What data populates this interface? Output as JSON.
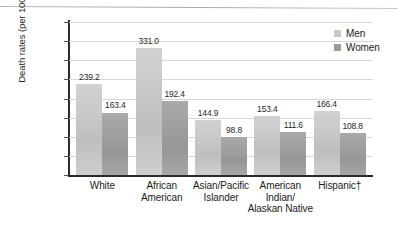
{
  "chart_data": {
    "type": "bar",
    "title": "",
    "xlabel": "",
    "ylabel": "Death rates (per 100,000)",
    "ylim": [
      0,
      400
    ],
    "ytick_step": 50,
    "yticks": [
      "400",
      "350",
      "300",
      "250",
      "200",
      "150",
      "100",
      "50",
      "0"
    ],
    "grid": true,
    "legend_position": "top-right",
    "categories": [
      "White",
      "African American",
      "Asian/Pacific Islander",
      "American Indian/ Alaskan Native",
      "Hispanic†"
    ],
    "category_lines": [
      [
        "White"
      ],
      [
        "African",
        "American"
      ],
      [
        "Asian/Pacific",
        "Islander"
      ],
      [
        "American",
        "Indian/",
        "Alaskan Native"
      ],
      [
        "Hispanic†"
      ]
    ],
    "series": [
      {
        "name": "Men",
        "color": "#c8c8c8",
        "values": [
          239.2,
          331.0,
          144.9,
          153.4,
          166.4
        ],
        "labels": [
          "239.2",
          "331.0",
          "144.9",
          "153.4",
          "166.4"
        ]
      },
      {
        "name": "Women",
        "color": "#9b9b9b",
        "values": [
          163.4,
          192.4,
          98.8,
          111.6,
          108.8
        ],
        "labels": [
          "163.4",
          "192.4",
          "98.8",
          "111.6",
          "108.8"
        ]
      }
    ]
  },
  "legend": {
    "items": [
      {
        "label": "Men",
        "swatch": "men"
      },
      {
        "label": "Women",
        "swatch": "women"
      }
    ]
  }
}
